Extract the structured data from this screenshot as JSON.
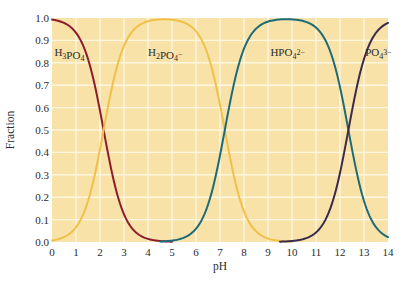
{
  "chart_data": {
    "type": "line",
    "title": "",
    "xlabel": "pH",
    "ylabel": "Fraction",
    "xlim": [
      0,
      14
    ],
    "ylim": [
      0,
      1.0
    ],
    "x_ticks": [
      "0",
      "1",
      "2",
      "3",
      "4",
      "5",
      "6",
      "7",
      "8",
      "9",
      "10",
      "11",
      "12",
      "13",
      "14"
    ],
    "y_ticks": [
      "0.0",
      "0.1",
      "0.2",
      "0.3",
      "0.4",
      "0.5",
      "0.6",
      "0.7",
      "0.8",
      "0.9",
      "1.0"
    ],
    "grid": true,
    "background_color": "#f8e2a8",
    "grid_color": "#fff6e0",
    "pKa": [
      2.15,
      7.2,
      12.35
    ],
    "series": [
      {
        "name": "H3PO4",
        "label_base": "H",
        "label_parts": [
          {
            "t": "H"
          },
          {
            "t": "3",
            "sub": true
          },
          {
            "t": "PO"
          },
          {
            "t": "4",
            "sub": true
          }
        ],
        "color": "#8c1d2c",
        "x": [
          0,
          0.5,
          1,
          1.5,
          2,
          2.15,
          2.5,
          3,
          3.5,
          4,
          4.5,
          5
        ],
        "values": [
          0.993,
          0.978,
          0.934,
          0.817,
          0.585,
          0.5,
          0.309,
          0.124,
          0.043,
          0.014,
          0.004,
          0.001
        ]
      },
      {
        "name": "H2PO4-",
        "label_parts": [
          {
            "t": "H"
          },
          {
            "t": "2",
            "sub": true
          },
          {
            "t": "PO"
          },
          {
            "t": "4",
            "sub": true
          },
          {
            "t": "−",
            "sup": true
          }
        ],
        "color": "#f0c14a",
        "x": [
          0,
          1,
          2,
          2.15,
          3,
          4,
          4.7,
          5,
          6,
          7,
          7.2,
          8,
          9,
          10
        ],
        "values": [
          0.007,
          0.066,
          0.415,
          0.5,
          0.876,
          0.985,
          0.994,
          0.993,
          0.94,
          0.613,
          0.5,
          0.137,
          0.016,
          0.002
        ]
      },
      {
        "name": "HPO4 2-",
        "label_parts": [
          {
            "t": "HPO"
          },
          {
            "t": "4",
            "sub": true
          },
          {
            "t": "2−",
            "sup": true
          }
        ],
        "color": "#1e6b78",
        "x": [
          4.5,
          5,
          6,
          7,
          7.2,
          8,
          9,
          9.8,
          10,
          11,
          12,
          12.35,
          13,
          14
        ],
        "values": [
          0.002,
          0.006,
          0.059,
          0.387,
          0.5,
          0.862,
          0.981,
          0.994,
          0.993,
          0.957,
          0.691,
          0.5,
          0.183,
          0.022
        ]
      },
      {
        "name": "PO4 3-",
        "label_parts": [
          {
            "t": "PO"
          },
          {
            "t": "4",
            "sub": true
          },
          {
            "t": "3−",
            "sup": true
          }
        ],
        "color": "#3a2b4e",
        "x": [
          9.5,
          10,
          11,
          12,
          12.35,
          13,
          14
        ],
        "values": [
          0.001,
          0.004,
          0.043,
          0.309,
          0.5,
          0.817,
          0.978
        ]
      }
    ],
    "annotations": [
      {
        "series": 0,
        "x": 0.1,
        "y": 0.83
      },
      {
        "series": 1,
        "x": 4.0,
        "y": 0.83
      },
      {
        "series": 2,
        "x": 9.1,
        "y": 0.83
      },
      {
        "series": 3,
        "x": 13.05,
        "y": 0.83
      }
    ]
  }
}
